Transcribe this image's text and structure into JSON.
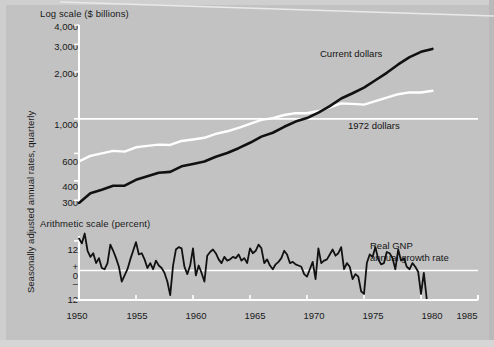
{
  "figure": {
    "background_color": "#c2c2c2",
    "axis_color": "#ffffff",
    "series_colors": {
      "current_dollars": "#111111",
      "dollars_1972": "#ffffff",
      "growth_rate": "#111111"
    }
  },
  "labels": {
    "top_panel_caption": "Log scale ($ billions)",
    "bottom_panel_caption": "Arithmetic scale (percent)",
    "vertical_axis_label": "Seasonally adjusted annual rates, quarterly",
    "annotation_current_dollars": "Current dollars",
    "annotation_1972_dollars": "1972 dollars",
    "annotation_real_gnp_line1": "Real GNP",
    "annotation_real_gnp_line2": "annual growth rate"
  },
  "top_panel_yticks": [
    "4,000",
    "3,000",
    "2,000",
    "1,000",
    "600",
    "400",
    "300"
  ],
  "bottom_panel_yticks": [
    "12",
    "+",
    "0",
    "–",
    "12"
  ],
  "xticks": [
    "1950",
    "1955",
    "1960",
    "1965",
    "1970",
    "1975",
    "1980",
    "1985"
  ],
  "chart_data": {
    "type": "line",
    "title": "",
    "subtitle": "",
    "panels": [
      {
        "name": "gnp-levels",
        "caption": "Log scale ($ billions)",
        "ylabel": "",
        "yscale": "log",
        "ylim": [
          280,
          4000
        ],
        "yticks": [
          300,
          400,
          600,
          1000,
          2000,
          3000,
          4000
        ],
        "ytick_labels": [
          "300",
          "400",
          "600",
          "1,000",
          "2,000",
          "3,000",
          "4,000"
        ],
        "xlim": [
          1950,
          1985
        ],
        "grid": false,
        "gridline_at": 1000,
        "series": [
          {
            "name": "Current dollars",
            "color": "#111111",
            "x": [
              1950,
              1951,
              1952,
              1953,
              1954,
              1955,
              1956,
              1957,
              1958,
              1959,
              1960,
              1961,
              1962,
              1963,
              1964,
              1965,
              1966,
              1967,
              1968,
              1969,
              1970,
              1971,
              1972,
              1973,
              1974,
              1975,
              1976,
              1977,
              1978,
              1979,
              1980,
              1981
            ],
            "values": [
              288,
              333,
              351,
              372,
              373,
              406,
              428,
              451,
              457,
              496,
              513,
              532,
              571,
              603,
              648,
              702,
              769,
              814,
              889,
              960,
              1011,
              1097,
              1207,
              1350,
              1459,
              1586,
              1768,
              1974,
              2233,
              2490,
              2690,
              2810
            ]
          },
          {
            "name": "1972 dollars",
            "color": "#ffffff",
            "x": [
              1950,
              1951,
              1952,
              1953,
              1954,
              1955,
              1956,
              1957,
              1958,
              1959,
              1960,
              1961,
              1962,
              1963,
              1964,
              1965,
              1966,
              1967,
              1968,
              1969,
              1970,
              1971,
              1972,
              1973,
              1974,
              1975,
              1976,
              1977,
              1978,
              1979,
              1980,
              1981
            ],
            "values": [
              534,
              579,
              600,
              623,
              616,
              657,
              671,
              683,
              680,
              721,
              737,
              756,
              800,
              832,
              876,
              929,
              984,
              1011,
              1058,
              1088,
              1086,
              1122,
              1186,
              1255,
              1248,
              1234,
              1298,
              1370,
              1439,
              1479,
              1475,
              1513
            ]
          }
        ]
      },
      {
        "name": "real-gnp-growth",
        "caption": "Arithmetic scale (percent)",
        "ylabel": "",
        "yscale": "linear",
        "ylim": [
          -12,
          14
        ],
        "yticks": [
          12,
          0,
          -12
        ],
        "ytick_labels": [
          "12",
          "0",
          "12"
        ],
        "sign_marks": {
          "plus_at": 4,
          "minus_at": -4
        },
        "xlim": [
          1950,
          1985
        ],
        "zero_line": 0,
        "series": [
          {
            "name": "Real GNP annual growth rate",
            "color": "#111111",
            "x": [
              1950.0,
              1950.25,
              1950.5,
              1950.75,
              1951.0,
              1951.25,
              1951.5,
              1951.75,
              1952.0,
              1952.25,
              1952.5,
              1952.75,
              1953.0,
              1953.25,
              1953.5,
              1953.75,
              1954.0,
              1954.25,
              1954.5,
              1954.75,
              1955.0,
              1955.25,
              1955.5,
              1955.75,
              1956.0,
              1956.25,
              1956.5,
              1956.75,
              1957.0,
              1957.25,
              1957.5,
              1957.75,
              1958.0,
              1958.25,
              1958.5,
              1958.75,
              1959.0,
              1959.25,
              1959.5,
              1959.75,
              1960.0,
              1960.25,
              1960.5,
              1960.75,
              1961.0,
              1961.25,
              1961.5,
              1961.75,
              1962.0,
              1962.25,
              1962.5,
              1962.75,
              1963.0,
              1963.25,
              1963.5,
              1963.75,
              1964.0,
              1964.25,
              1964.5,
              1964.75,
              1965.0,
              1965.25,
              1965.5,
              1965.75,
              1966.0,
              1966.25,
              1966.5,
              1966.75,
              1967.0,
              1967.25,
              1967.5,
              1967.75,
              1968.0,
              1968.25,
              1968.5,
              1968.75,
              1969.0,
              1969.25,
              1969.5,
              1969.75,
              1970.0,
              1970.25,
              1970.5,
              1970.75,
              1971.0,
              1971.25,
              1971.5,
              1971.75,
              1972.0,
              1972.25,
              1972.5,
              1972.75,
              1973.0,
              1973.25,
              1973.5,
              1973.75,
              1974.0,
              1974.25,
              1974.5,
              1974.75,
              1975.0,
              1975.25,
              1975.5,
              1975.75,
              1976.0,
              1976.25,
              1976.5,
              1976.75,
              1977.0,
              1977.25,
              1977.5,
              1977.75,
              1978.0,
              1978.25,
              1978.5,
              1978.75,
              1979.0,
              1979.25,
              1979.5,
              1979.75,
              1980.0,
              1980.25,
              1980.5,
              1980.75
            ],
            "values": [
              13.0,
              11.0,
              15.0,
              8.0,
              5.5,
              7.0,
              3.0,
              5.0,
              1.0,
              0.5,
              3.0,
              10.5,
              8.0,
              5.0,
              1.5,
              -4.5,
              -2.0,
              0.5,
              4.5,
              8.0,
              11.5,
              6.5,
              7.0,
              4.5,
              1.0,
              3.0,
              0.5,
              4.0,
              2.0,
              1.0,
              -1.0,
              -4.5,
              -10.0,
              2.0,
              8.5,
              9.5,
              9.0,
              1.5,
              -1.5,
              2.0,
              9.0,
              -2.0,
              2.0,
              -1.0,
              -4.5,
              6.0,
              7.5,
              8.5,
              7.0,
              4.5,
              3.0,
              5.5,
              4.0,
              4.5,
              5.5,
              5.0,
              6.5,
              4.0,
              5.0,
              3.0,
              9.0,
              7.0,
              8.0,
              10.5,
              9.0,
              3.0,
              4.5,
              2.0,
              0.5,
              2.5,
              3.5,
              5.0,
              8.0,
              6.5,
              3.0,
              3.5,
              2.5,
              2.0,
              1.5,
              -1.5,
              -2.5,
              0.5,
              3.5,
              -3.5,
              9.0,
              3.0,
              4.0,
              4.5,
              6.5,
              8.5,
              6.0,
              7.0,
              9.5,
              0.5,
              3.0,
              1.5,
              -3.5,
              -1.5,
              -2.5,
              -8.5,
              -9.5,
              3.0,
              6.5,
              5.5,
              9.5,
              4.5,
              2.5,
              3.0,
              7.5,
              7.0,
              5.0,
              0.5,
              8.5,
              4.0,
              5.0,
              1.5,
              0.5,
              3.0,
              1.5,
              -0.5,
              -9.5,
              -1.0,
              -11.5
            ]
          }
        ]
      }
    ]
  }
}
